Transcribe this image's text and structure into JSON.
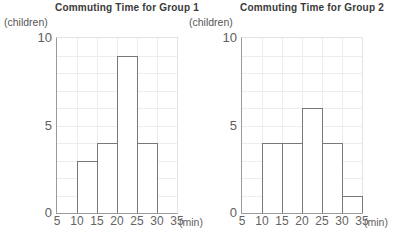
{
  "page": {
    "background": "#ffffff"
  },
  "colors": {
    "title_text": "#3a3a3a",
    "tick_text": "#636363",
    "grid_line": "#ededed",
    "axis_line": "#9b9b9b",
    "bar_outline": "#787878",
    "bar_fill": "#ffffff"
  },
  "chart_data": [
    {
      "type": "bar",
      "chart_kind": "histogram",
      "title": "Commuting Time for Group 1",
      "ylabel": "(children)",
      "xlabel": "(min)",
      "categories": [
        "5-10",
        "10-15",
        "15-20",
        "20-25",
        "25-30",
        "30-35"
      ],
      "values": [
        0,
        3,
        4,
        9,
        4,
        0
      ],
      "x_ticks": [
        5,
        10,
        15,
        20,
        25,
        30,
        35
      ],
      "y_ticks": [
        0,
        5,
        10
      ],
      "xlim": [
        5,
        35
      ],
      "ylim": [
        0,
        10
      ],
      "bin_width_min": 5,
      "grid": true,
      "legend": "none"
    },
    {
      "type": "bar",
      "chart_kind": "histogram",
      "title": "Commuting Time for Group 2",
      "ylabel": "(children)",
      "xlabel": "(min)",
      "categories": [
        "5-10",
        "10-15",
        "15-20",
        "20-25",
        "25-30",
        "30-35"
      ],
      "values": [
        0,
        4,
        4,
        6,
        4,
        1
      ],
      "x_ticks": [
        5,
        10,
        15,
        20,
        25,
        30,
        35
      ],
      "y_ticks": [
        0,
        5,
        10
      ],
      "xlim": [
        5,
        35
      ],
      "ylim": [
        0,
        10
      ],
      "bin_width_min": 5,
      "grid": true,
      "legend": "none"
    }
  ]
}
